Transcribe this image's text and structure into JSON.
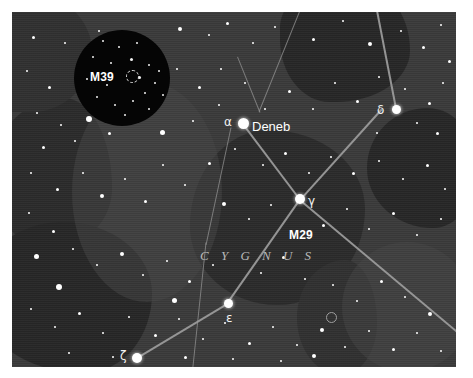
{
  "chart": {
    "type": "star-chart",
    "constellation_label": "C Y G N U S",
    "background_color": "#3a3a3a",
    "plate": {
      "x": 12,
      "y": 12,
      "width": 444,
      "height": 355
    }
  },
  "labels": {
    "alpha": "α",
    "deneb": "Deneb",
    "gamma": "γ",
    "delta": "δ",
    "epsilon": "ε",
    "zeta": "ζ",
    "m29": "M29",
    "m39": "M39"
  },
  "stars": [
    {
      "name": "Deneb",
      "designation": "α",
      "x": 243,
      "y": 123,
      "size": 11
    },
    {
      "name": "Sadr",
      "designation": "γ",
      "x": 300,
      "y": 199,
      "size": 9
    },
    {
      "name": "Delta Cygni",
      "designation": "δ",
      "x": 396,
      "y": 109,
      "size": 8
    },
    {
      "name": "Gienah",
      "designation": "ε",
      "x": 228,
      "y": 303,
      "size": 8
    },
    {
      "name": "Albireo",
      "designation": "ζ",
      "x": 137,
      "y": 358,
      "size": 9
    }
  ],
  "deep_sky_objects": [
    {
      "name": "M39",
      "type": "open cluster",
      "x": 110,
      "y": 60,
      "inset": true
    },
    {
      "name": "M29",
      "type": "open cluster",
      "x": 307,
      "y": 228,
      "inset": false
    }
  ],
  "inset": {
    "label": "M39",
    "shape": "circle",
    "center_x": 110,
    "center_y": 66,
    "radius": 48,
    "background_color": "#050505"
  },
  "constellation_lines": [
    {
      "from": "α",
      "to": "γ"
    },
    {
      "from": "γ",
      "to": "δ"
    },
    {
      "from": "γ",
      "to": "ε"
    },
    {
      "from": "ε",
      "to": "ζ"
    },
    {
      "from": "γ",
      "to": "lower-right-edge"
    }
  ],
  "colors": {
    "star": "#ffffff",
    "line": "#9a9a9a",
    "label": "#ffffff",
    "constellation_name": "#b9b9b9",
    "nebula_dark": "#2a2a2a"
  }
}
